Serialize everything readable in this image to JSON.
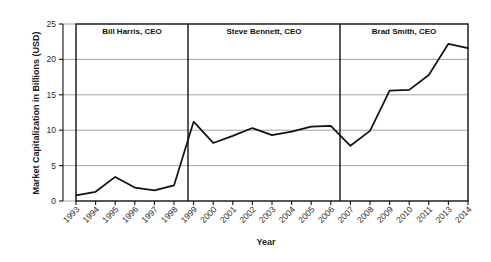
{
  "chart_data": {
    "type": "line",
    "title": "",
    "xlabel": "Year",
    "ylabel": "Market Capitalization in Billions (USD)",
    "categories": [
      "1993",
      "1994",
      "1995",
      "1996",
      "1997",
      "1998",
      "1999",
      "2000",
      "2001",
      "2002",
      "2003",
      "2004",
      "2005",
      "2006",
      "2007",
      "2008",
      "2009",
      "2010",
      "2011",
      "2013",
      "2014"
    ],
    "values": [
      0.8,
      1.3,
      3.4,
      1.9,
      1.5,
      2.2,
      11.2,
      8.2,
      9.2,
      10.3,
      9.3,
      9.8,
      10.5,
      10.6,
      7.8,
      9.9,
      15.6,
      15.7,
      17.8,
      22.2,
      21.6
    ],
    "series": [
      {
        "name": "Market Capitalization",
        "values": [
          0.8,
          1.3,
          3.4,
          1.9,
          1.5,
          2.2,
          11.2,
          8.2,
          9.2,
          10.3,
          9.3,
          9.8,
          10.5,
          10.6,
          7.8,
          9.9,
          15.6,
          15.7,
          17.8,
          22.2,
          21.6
        ]
      }
    ],
    "ylim": [
      0,
      25
    ],
    "yticks": [
      0,
      5,
      10,
      15,
      20,
      25
    ],
    "grid": true,
    "legend": "none",
    "line_color": "#111111",
    "grid_color": "#8a8a8a",
    "annotations": [
      {
        "label": "Bill Harris, CEO",
        "start": "1993",
        "end": "1999"
      },
      {
        "label": "Steve Bennett, CEO",
        "start": "1999",
        "end": "2007"
      },
      {
        "label": "Brad Smith, CEO",
        "start": "2007",
        "end": "2014"
      }
    ]
  }
}
